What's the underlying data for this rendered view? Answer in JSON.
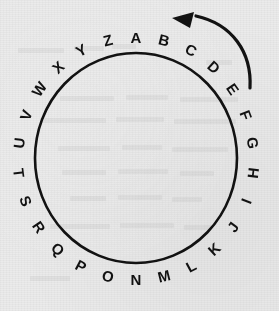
{
  "figure": {
    "name": "alphabet-circle-wheel",
    "background_color": "#ebebeb",
    "ink_color": "#121212"
  },
  "circle": {
    "center_x": 136,
    "center_y": 158,
    "radius_x": 101,
    "radius_y": 105,
    "stroke_width": 2.6
  },
  "ring": {
    "letter_radius_x": 118,
    "letter_radius_y": 122,
    "font_size": 15,
    "letters": [
      {
        "char": "A",
        "angle": -90,
        "x": 136,
        "y": 37,
        "rotation": 0
      },
      {
        "char": "B",
        "angle": -76.15,
        "x": 164,
        "y": 40,
        "rotation": 14
      },
      {
        "char": "C",
        "angle": -62.3,
        "x": 191,
        "y": 50,
        "rotation": 28
      },
      {
        "char": "D",
        "angle": -48.46,
        "x": 214,
        "y": 67,
        "rotation": 42
      },
      {
        "char": "E",
        "angle": -34.61,
        "x": 233,
        "y": 89,
        "rotation": 55
      },
      {
        "char": "F",
        "angle": -20.77,
        "x": 246,
        "y": 115,
        "rotation": 69
      },
      {
        "char": "G",
        "angle": -6.92,
        "x": 253,
        "y": 143,
        "rotation": 83
      },
      {
        "char": "H",
        "angle": 6.92,
        "x": 253,
        "y": 173,
        "rotation": -83
      },
      {
        "char": "I",
        "angle": 20.77,
        "x": 246,
        "y": 201,
        "rotation": -69
      },
      {
        "char": "J",
        "angle": 34.61,
        "x": 233,
        "y": 227,
        "rotation": -55
      },
      {
        "char": "K",
        "angle": 48.46,
        "x": 214,
        "y": 249,
        "rotation": -42
      },
      {
        "char": "L",
        "angle": 62.3,
        "x": 191,
        "y": 266,
        "rotation": -28
      },
      {
        "char": "M",
        "angle": 76.15,
        "x": 164,
        "y": 276,
        "rotation": -14
      },
      {
        "char": "N",
        "angle": 90,
        "x": 136,
        "y": 279,
        "rotation": 0
      },
      {
        "char": "O",
        "angle": 103.85,
        "x": 108,
        "y": 276,
        "rotation": 14
      },
      {
        "char": "P",
        "angle": 117.69,
        "x": 81,
        "y": 266,
        "rotation": 28
      },
      {
        "char": "Q",
        "angle": 131.54,
        "x": 58,
        "y": 249,
        "rotation": 42
      },
      {
        "char": "R",
        "angle": 145.38,
        "x": 39,
        "y": 227,
        "rotation": 55
      },
      {
        "char": "S",
        "angle": 159.23,
        "x": 26,
        "y": 201,
        "rotation": 69
      },
      {
        "char": "T",
        "angle": 173.08,
        "x": 19,
        "y": 173,
        "rotation": 83
      },
      {
        "char": "U",
        "angle": 186.92,
        "x": 19,
        "y": 143,
        "rotation": -83
      },
      {
        "char": "V",
        "angle": 200.77,
        "x": 26,
        "y": 115,
        "rotation": -69
      },
      {
        "char": "W",
        "angle": 214.61,
        "x": 39,
        "y": 89,
        "rotation": -55
      },
      {
        "char": "X",
        "angle": 228.46,
        "x": 58,
        "y": 67,
        "rotation": -42
      },
      {
        "char": "Y",
        "angle": 242.3,
        "x": 81,
        "y": 50,
        "rotation": -28
      },
      {
        "char": "Z",
        "angle": 256.15,
        "x": 108,
        "y": 40,
        "rotation": -14
      }
    ]
  },
  "direction_arrow": {
    "name": "counterclockwise-arrow",
    "label": "counterclockwise",
    "path": "M 250,88 C 252,52 232,24 196,16",
    "stroke_width": 3.2,
    "head_points": "172,18 194,12 190,28",
    "tail_x": 250,
    "tail_y": 88,
    "tip_x": 172,
    "tip_y": 18
  },
  "bleed_marks": [
    {
      "x": 18,
      "y": 48,
      "w": 46
    },
    {
      "x": 74,
      "y": 46,
      "w": 30
    },
    {
      "x": 112,
      "y": 44,
      "w": 24
    },
    {
      "x": 60,
      "y": 96,
      "w": 54
    },
    {
      "x": 126,
      "y": 95,
      "w": 42
    },
    {
      "x": 180,
      "y": 97,
      "w": 58
    },
    {
      "x": 40,
      "y": 118,
      "w": 66
    },
    {
      "x": 116,
      "y": 117,
      "w": 48
    },
    {
      "x": 174,
      "y": 119,
      "w": 62
    },
    {
      "x": 58,
      "y": 146,
      "w": 52
    },
    {
      "x": 122,
      "y": 145,
      "w": 40
    },
    {
      "x": 172,
      "y": 147,
      "w": 56
    },
    {
      "x": 62,
      "y": 170,
      "w": 44
    },
    {
      "x": 118,
      "y": 169,
      "w": 50
    },
    {
      "x": 180,
      "y": 171,
      "w": 34
    },
    {
      "x": 70,
      "y": 196,
      "w": 36
    },
    {
      "x": 118,
      "y": 195,
      "w": 44
    },
    {
      "x": 172,
      "y": 197,
      "w": 30
    },
    {
      "x": 50,
      "y": 224,
      "w": 60
    },
    {
      "x": 120,
      "y": 223,
      "w": 54
    },
    {
      "x": 184,
      "y": 225,
      "w": 28
    },
    {
      "x": 30,
      "y": 276,
      "w": 40
    },
    {
      "x": 206,
      "y": 60,
      "w": 26
    }
  ]
}
